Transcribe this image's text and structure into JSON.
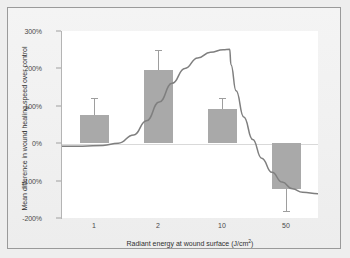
{
  "figure": {
    "background_color": "#efefef",
    "frame_border_color": "#9a9a9a",
    "plot_background_color": "#ffffff",
    "bar_color": "#a9a9a9",
    "curve_color": "#7f7f7f",
    "zero_line_color": "#d9d9d9"
  },
  "chart_data": {
    "type": "bar",
    "title": "",
    "xlabel": "Radiant energy at wound surface (J/cm²)",
    "ylabel": "Mean difference in wound healing speed over control",
    "categories": [
      "1",
      "2",
      "10",
      "50"
    ],
    "values": [
      75,
      195,
      92,
      -122
    ],
    "errors": [
      45,
      55,
      30,
      58
    ],
    "value_labels": [
      "75%",
      "195%",
      "92%",
      "-122%"
    ],
    "ylim": [
      -200,
      300
    ],
    "yticks": [
      300,
      200,
      100,
      0,
      -100,
      -200
    ],
    "ytick_labels": [
      "300%",
      "200%",
      "100%",
      "0%",
      "-100%",
      "-200%"
    ],
    "grid": false,
    "legend": "none",
    "series": [
      {
        "name": "Mean difference",
        "type": "bar",
        "values": [
          75,
          195,
          92,
          -122
        ],
        "errors": [
          45,
          55,
          30,
          58
        ]
      },
      {
        "name": "Arndt-Schultz response curve",
        "type": "line",
        "description": "biphasic dose response curve rising to a plateau near 250% then falling steeply to about -135%",
        "points": [
          {
            "x": 0.0,
            "y": -8
          },
          {
            "x": 0.08,
            "y": -8
          },
          {
            "x": 0.16,
            "y": -6
          },
          {
            "x": 0.22,
            "y": 0
          },
          {
            "x": 0.28,
            "y": 22
          },
          {
            "x": 0.33,
            "y": 60
          },
          {
            "x": 0.38,
            "y": 110
          },
          {
            "x": 0.43,
            "y": 160
          },
          {
            "x": 0.48,
            "y": 200
          },
          {
            "x": 0.53,
            "y": 228
          },
          {
            "x": 0.58,
            "y": 243
          },
          {
            "x": 0.63,
            "y": 250
          },
          {
            "x": 0.655,
            "y": 251
          },
          {
            "x": 0.66,
            "y": 210
          },
          {
            "x": 0.68,
            "y": 140
          },
          {
            "x": 0.71,
            "y": 70
          },
          {
            "x": 0.745,
            "y": 10
          },
          {
            "x": 0.78,
            "y": -40
          },
          {
            "x": 0.82,
            "y": -78
          },
          {
            "x": 0.86,
            "y": -104
          },
          {
            "x": 0.9,
            "y": -122
          },
          {
            "x": 0.94,
            "y": -131
          },
          {
            "x": 1.0,
            "y": -135
          }
        ]
      }
    ]
  }
}
